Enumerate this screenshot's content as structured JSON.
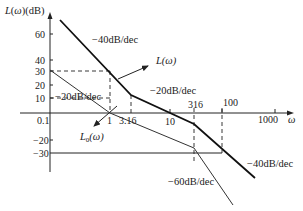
{
  "diagram": {
    "type": "bode_magnitude_asymptotic",
    "y_axis_label": "L(ω)(dB)",
    "x_axis_label": "ω",
    "y_ticks": [
      "60",
      "40",
      "30",
      "20",
      "10",
      "-20",
      "-30"
    ],
    "x_ticks": [
      "0.1",
      "1",
      "3.16",
      "10",
      "316",
      "100",
      "1000"
    ],
    "curves": {
      "compensated": {
        "label": "L(ω)",
        "slopes": [
          "-40dB/dec",
          "-20dB/dec",
          "-40dB/dec"
        ]
      },
      "original": {
        "label": "L₀(ω)",
        "slopes": [
          "-20dB/dec",
          "-40dB/dec",
          "-60dB/dec"
        ]
      }
    },
    "annotations": {
      "slope_top": "−40dB/dec",
      "slope_mid_right": "−20dB/dec",
      "slope_left": "−20dB/dec",
      "slope_bottom_right": "−40dB/dec",
      "slope_bottom": "−60dB/dec",
      "L_label": "L(ω)",
      "L0_label": "L",
      "L0_sub": "0",
      "L0_suffix": "(ω)"
    },
    "tick_labels": {
      "y60": "60",
      "y40": "40",
      "y30": "30",
      "y20": "20",
      "y10": "10",
      "ym20": "−20",
      "ym30": "−30",
      "x01": "0.1",
      "x1": "1",
      "x316a": "3.16",
      "x10": "10",
      "x316b": "316",
      "x100": "100",
      "x1000": "1000"
    },
    "axis_labels": {
      "y": "L(ω)(dB)",
      "x": "ω"
    }
  }
}
